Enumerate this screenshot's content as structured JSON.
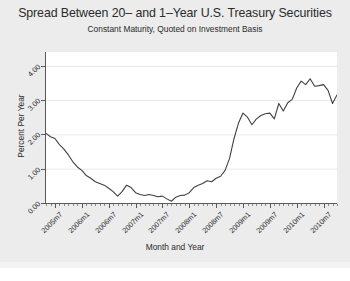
{
  "figure": {
    "background_color": "#ececec",
    "plot_background_color": "#ffffff",
    "line_color": "#404040",
    "grid_color": "#e8e8e8",
    "axis_color": "#5a5a5a"
  },
  "chart_data": {
    "type": "line",
    "title": "Spread Between 20– and 1–Year U.S. Treasury Securities",
    "subtitle": "Constant Maturity, Quoted on Investment Basis",
    "xlabel": "Month and Year",
    "ylabel": "Percent Per Year",
    "ylim": [
      0.0,
      4.4
    ],
    "yticks": [
      0.0,
      1.0,
      2.0,
      3.0,
      4.0
    ],
    "ytick_labels": [
      "0.00",
      "1.00",
      "2.00",
      "3.00",
      "4.00"
    ],
    "xticks": [
      "2005m7",
      "2006m1",
      "2006m7",
      "2007m1",
      "2007m7",
      "2008m1",
      "2008m7",
      "2009m1",
      "2009m7",
      "2010m1",
      "2010m7"
    ],
    "xlim": [
      "2005m5",
      "2010m11"
    ],
    "grid": true,
    "grid_axis": "y",
    "legend": false,
    "x": [
      "2005m5",
      "2005m6",
      "2005m7",
      "2005m8",
      "2005m9",
      "2005m10",
      "2005m11",
      "2005m12",
      "2006m1",
      "2006m2",
      "2006m3",
      "2006m4",
      "2006m5",
      "2006m6",
      "2006m7",
      "2006m8",
      "2006m9",
      "2006m10",
      "2006m11",
      "2006m12",
      "2007m1",
      "2007m2",
      "2007m3",
      "2007m4",
      "2007m5",
      "2007m6",
      "2007m7",
      "2007m8",
      "2007m9",
      "2007m10",
      "2007m11",
      "2007m12",
      "2008m1",
      "2008m2",
      "2008m3",
      "2008m4",
      "2008m5",
      "2008m6",
      "2008m7",
      "2008m8",
      "2008m9",
      "2008m10",
      "2008m11",
      "2008m12",
      "2009m1",
      "2009m2",
      "2009m3",
      "2009m4",
      "2009m5",
      "2009m6",
      "2009m7",
      "2009m8",
      "2009m9",
      "2009m10",
      "2009m11",
      "2009m12",
      "2010m1",
      "2010m2",
      "2010m3",
      "2010m4",
      "2010m5",
      "2010m6",
      "2010m7",
      "2010m8",
      "2010m9",
      "2010m10"
    ],
    "values": [
      2.03,
      1.93,
      1.88,
      1.7,
      1.57,
      1.4,
      1.2,
      1.05,
      0.95,
      0.8,
      0.72,
      0.62,
      0.57,
      0.52,
      0.43,
      0.33,
      0.2,
      0.33,
      0.52,
      0.45,
      0.3,
      0.25,
      0.22,
      0.25,
      0.22,
      0.18,
      0.2,
      0.12,
      0.05,
      0.17,
      0.22,
      0.23,
      0.3,
      0.45,
      0.52,
      0.57,
      0.65,
      0.62,
      0.72,
      0.78,
      0.95,
      1.3,
      1.88,
      2.33,
      2.62,
      2.5,
      2.28,
      2.45,
      2.55,
      2.6,
      2.62,
      2.45,
      2.9,
      2.68,
      2.92,
      3.02,
      3.35,
      3.55,
      3.45,
      3.62,
      3.4,
      3.42,
      3.45,
      3.28,
      2.9,
      3.15
    ],
    "series_note": "Monthly spread, 20-year minus 1-year U.S. Treasury constant maturity yield"
  }
}
